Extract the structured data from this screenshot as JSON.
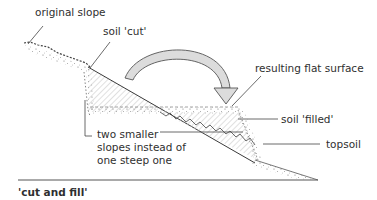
{
  "diagram": {
    "caption": "'cut and fill'",
    "labels": {
      "original_slope": "original slope",
      "soil_cut": "soil 'cut'",
      "resulting_flat_surface": "resulting flat surface",
      "soil_filled": "soil 'filled'",
      "topsoil": "topsoil",
      "two_smaller_line1": "two smaller",
      "two_smaller_line2": "slopes instead of",
      "two_smaller_line3": "one steep one"
    },
    "icons": {
      "arrow": "curved-arrow-icon"
    },
    "colors": {
      "line": "#3a3a3a",
      "hatch": "#c8c8c8",
      "arrow_fill": "#d9d9d9",
      "speckle": "#555555"
    }
  }
}
